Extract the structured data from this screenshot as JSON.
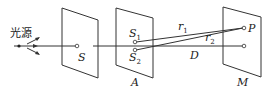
{
  "diagram": {
    "source_label": "光源",
    "labels": {
      "S": "S",
      "S1": "S",
      "S1_sub": "1",
      "S2": "S",
      "S2_sub": "2",
      "r1": "r",
      "r1_sub": "1",
      "r2": "r",
      "r2_sub": "2",
      "P": "P",
      "D": "D",
      "A": "A",
      "M": "M"
    },
    "colors": {
      "line": "#333333",
      "background": "#ffffff"
    }
  }
}
